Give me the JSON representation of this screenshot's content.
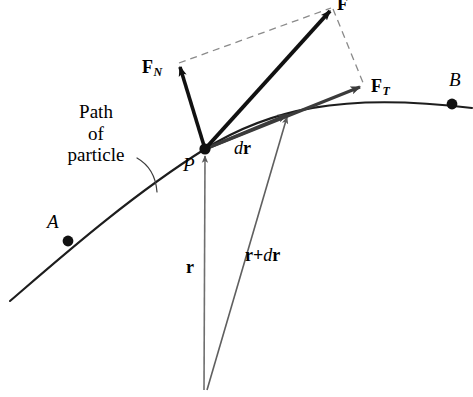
{
  "figure": {
    "background_color": "#ffffff",
    "width": 473,
    "height": 397
  },
  "colors": {
    "stroke_black": "#111111",
    "stroke_dark_gray": "#3b3b3b",
    "stroke_gray": "#6f6f6f",
    "stroke_thin": "#4a4a4a",
    "dashed": "#8a8a8a",
    "text": "#000000"
  },
  "labels": {
    "caption_line1": "Path",
    "caption_line2": "of",
    "caption_line3": "particle",
    "point_a": "A",
    "point_b": "B",
    "point_p": "P",
    "force_resultant": "F",
    "force_normal_base": "F",
    "force_normal_sub": "N",
    "force_tangential_base": "F",
    "force_tangential_sub": "T",
    "displacement_d": "d",
    "displacement_r": "r",
    "position_r": "r",
    "position_sum_r": "r",
    "position_sum_plus": "+",
    "position_sum_d": "d",
    "position_sum_r2": "r"
  },
  "geometry": {
    "point_p": {
      "x": 205,
      "y": 149,
      "label_x": 184,
      "label_y": 163
    },
    "point_a": {
      "x": 68,
      "y": 241,
      "label_x": 47,
      "label_y": 221
    },
    "point_b": {
      "x": 452,
      "y": 104,
      "label_x": 450,
      "label_y": 78
    },
    "origin": {
      "x": 206,
      "y": 390
    },
    "force_resultant_tip": {
      "x": 331,
      "y": 7
    },
    "force_normal_tip": {
      "x": 178,
      "y": 63
    },
    "force_tangential_tip": {
      "x": 363,
      "y": 86
    },
    "dr_tip": {
      "x": 289,
      "y": 113
    },
    "curve_start": {
      "x": 10,
      "y": 301
    },
    "curve_end": {
      "x": 472,
      "y": 108
    }
  },
  "elements": {
    "path_curve": "particle trajectory arc from lower-left through A, P to B",
    "vector_f": "resultant force F from P",
    "vector_fn": "normal force component F_N from P",
    "vector_ft": "tangential force component F_T from P",
    "vector_dr": "displacement dr along tangent from P",
    "vector_r": "position vector r from origin to P",
    "vector_r_plus_dr": "position vector r+dr from origin to dr tip",
    "parallelogram": "dashed parallelogram completing F from F_N and F_T"
  }
}
